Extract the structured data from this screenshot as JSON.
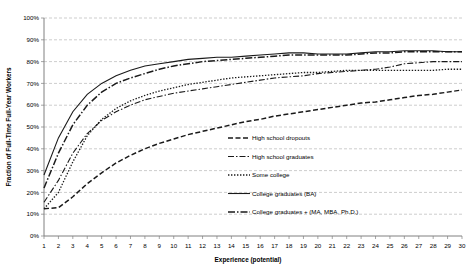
{
  "chart_data": {
    "type": "line",
    "title": "",
    "xlabel": "Experience (potential)",
    "ylabel": "Fraction of Full-Time Full-Year Workers",
    "grid": true,
    "legend_position": "inside-lower-right",
    "xlim": [
      1,
      30
    ],
    "ylim": [
      0,
      100
    ],
    "yticks": [
      "0%",
      "10%",
      "20%",
      "30%",
      "40%",
      "50%",
      "60%",
      "70%",
      "80%",
      "90%",
      "100%"
    ],
    "ytick_values": [
      0,
      10,
      20,
      30,
      40,
      50,
      60,
      70,
      80,
      90,
      100
    ],
    "x": [
      1,
      2,
      3,
      4,
      5,
      6,
      7,
      8,
      9,
      10,
      11,
      12,
      13,
      14,
      15,
      16,
      17,
      18,
      19,
      20,
      21,
      22,
      23,
      24,
      25,
      26,
      27,
      28,
      29,
      30
    ],
    "xticks": [
      "1",
      "2",
      "3",
      "4",
      "5",
      "6",
      "7",
      "8",
      "9",
      "10",
      "11",
      "12",
      "13",
      "14",
      "15",
      "16",
      "17",
      "18",
      "19",
      "20",
      "21",
      "22",
      "23",
      "24",
      "25",
      "26",
      "27",
      "28",
      "29",
      "30"
    ],
    "series": [
      {
        "name": "High school dropouts",
        "style": "dashed",
        "dash": "5 2.5",
        "width": 1.5,
        "values": [
          12.5,
          13.0,
          18.0,
          24.0,
          29.0,
          33.5,
          37.0,
          40.0,
          42.5,
          44.5,
          46.5,
          48.0,
          49.5,
          51.0,
          52.5,
          53.5,
          55.0,
          56.0,
          57.0,
          58.0,
          59.0,
          60.0,
          61.0,
          61.5,
          62.5,
          63.5,
          64.5,
          65.0,
          66.0,
          67.0
        ]
      },
      {
        "name": "High school graduates",
        "style": "dash-dot",
        "dash": "6 2 1.5 2",
        "width": 1.1,
        "values": [
          15.5,
          25.5,
          38.0,
          47.0,
          53.0,
          57.0,
          60.0,
          62.5,
          64.0,
          65.5,
          66.5,
          67.5,
          68.5,
          69.5,
          70.5,
          71.5,
          72.5,
          73.0,
          73.5,
          74.5,
          75.0,
          75.5,
          76.0,
          76.5,
          77.5,
          79.0,
          79.5,
          80.0,
          80.0,
          80.0
        ]
      },
      {
        "name": "Some college",
        "style": "dotted",
        "dash": "1.4 1.6",
        "width": 1.3,
        "values": [
          12.5,
          20.0,
          34.0,
          46.0,
          53.5,
          58.5,
          62.0,
          64.5,
          66.5,
          68.0,
          69.5,
          70.5,
          71.5,
          72.5,
          73.0,
          73.5,
          74.0,
          74.5,
          75.0,
          75.0,
          75.5,
          76.0,
          76.0,
          76.0,
          76.0,
          76.0,
          76.0,
          76.0,
          76.5,
          76.5
        ]
      },
      {
        "name": "College graduates (BA)",
        "style": "solid",
        "dash": "none",
        "width": 1.1,
        "values": [
          28.0,
          45.0,
          57.0,
          65.0,
          70.0,
          73.5,
          76.0,
          78.0,
          79.0,
          80.0,
          81.0,
          81.5,
          82.0,
          82.0,
          82.5,
          83.0,
          83.5,
          84.0,
          84.0,
          83.5,
          83.5,
          83.5,
          84.0,
          84.5,
          84.5,
          85.0,
          85.0,
          85.0,
          84.5,
          84.5
        ]
      },
      {
        "name": "College graduates + (MA, MBA, Ph.D.)",
        "style": "long-dash-dot",
        "dash": "7 2 1.5 2",
        "width": 1.5,
        "values": [
          22.0,
          38.0,
          51.0,
          60.0,
          66.0,
          70.0,
          72.5,
          74.5,
          76.5,
          78.0,
          79.0,
          80.0,
          80.5,
          81.0,
          81.5,
          82.0,
          82.5,
          83.0,
          83.0,
          83.0,
          83.0,
          83.0,
          83.5,
          84.0,
          84.0,
          84.5,
          84.5,
          84.5,
          84.5,
          84.5
        ]
      }
    ]
  },
  "legend": {
    "items": [
      {
        "label": "High school dropouts"
      },
      {
        "label": "High school graduates"
      },
      {
        "label": "Some college"
      },
      {
        "label": "College graduates (BA)"
      },
      {
        "label": "College graduates + (MA, MBA, Ph.D.)"
      }
    ]
  }
}
